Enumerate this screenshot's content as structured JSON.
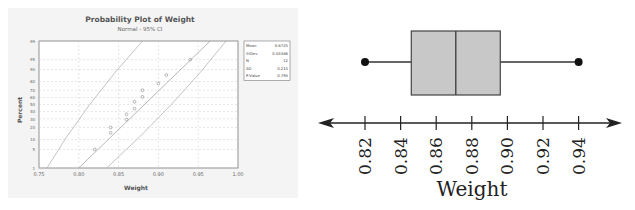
{
  "chart_data": [
    {
      "type": "scatter",
      "title": "Probability Plot of Weight",
      "subtitle": "Normal - 95% CI",
      "xlabel": "Weight",
      "ylabel": "Percent",
      "xlim": [
        0.75,
        1.0
      ],
      "x_ticks": [
        "0.75",
        "0.80",
        "0.85",
        "0.90",
        "0.95",
        "1.00"
      ],
      "y_ticks": [
        "1",
        "5",
        "10",
        "20",
        "30",
        "40",
        "50",
        "60",
        "70",
        "80",
        "90",
        "95",
        "99"
      ],
      "grid": true,
      "points": [
        {
          "x": 0.82,
          "y": 5
        },
        {
          "x": 0.84,
          "y": 15
        },
        {
          "x": 0.84,
          "y": 20
        },
        {
          "x": 0.86,
          "y": 29
        },
        {
          "x": 0.86,
          "y": 36
        },
        {
          "x": 0.87,
          "y": 44
        },
        {
          "x": 0.87,
          "y": 54
        },
        {
          "x": 0.88,
          "y": 61
        },
        {
          "x": 0.88,
          "y": 70
        },
        {
          "x": 0.9,
          "y": 78
        },
        {
          "x": 0.91,
          "y": 86
        },
        {
          "x": 0.94,
          "y": 95
        }
      ],
      "fit_line": {
        "from": {
          "x": 0.8,
          "y": 1
        },
        "to": {
          "x": 0.965,
          "y": 99
        }
      },
      "ci_lower": {
        "from": {
          "x": 0.76,
          "y": 1
        },
        "to": {
          "x": 0.88,
          "y": 99
        }
      },
      "ci_upper": {
        "from": {
          "x": 0.835,
          "y": 1
        },
        "to": {
          "x": 0.985,
          "y": 99
        }
      },
      "stats": [
        {
          "label": "Mean",
          "value": "0.8725"
        },
        {
          "label": "StDev",
          "value": "0.03386"
        },
        {
          "label": "N",
          "value": "12"
        },
        {
          "label": "AD",
          "value": "0.215"
        },
        {
          "label": "P-Value",
          "value": "0.793"
        }
      ]
    },
    {
      "type": "boxplot",
      "xlabel": "Weight",
      "x_ticks": [
        "0.82",
        "0.84",
        "0.86",
        "0.88",
        "0.90",
        "0.92",
        "0.94"
      ],
      "min": 0.82,
      "q1": 0.846,
      "median": 0.871,
      "q3": 0.896,
      "max": 0.94,
      "box_color": "#c8c8c8"
    }
  ]
}
